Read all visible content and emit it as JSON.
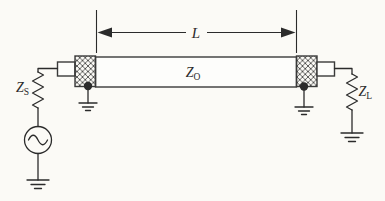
{
  "figure": {
    "kind": "transmission-line circuit schematic",
    "dimension": {
      "label": "L"
    },
    "transmission_line": {
      "label_main": "Z",
      "label_sub": "O"
    },
    "source_impedance": {
      "label_main": "Z",
      "label_sub": "S"
    },
    "load_impedance": {
      "label_main": "Z",
      "label_sub": "L"
    },
    "colors": {
      "ink": "#2b2b2b",
      "paper": "#fbfaf6"
    }
  }
}
